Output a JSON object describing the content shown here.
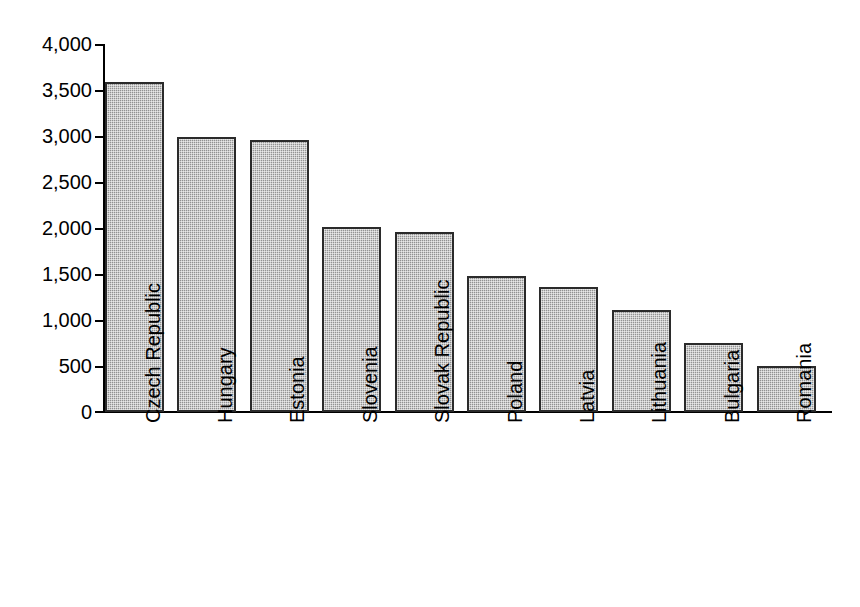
{
  "chart_data": {
    "type": "bar",
    "title": "",
    "subtitle": "",
    "xlabel": "",
    "ylabel": "",
    "ylim": [
      0,
      4000
    ],
    "ytick_step": 500,
    "grid": false,
    "legend": null,
    "bar_fill_color": "#a3a3a3",
    "bar_border_color": "#2b2b2b",
    "axis_color": "#000000",
    "background_color": "#ffffff",
    "ytick_labels": [
      "4,000",
      "3,500",
      "3,000",
      "2,500",
      "2,000",
      "1,500",
      "1,000",
      "500",
      "0"
    ],
    "ytick_values": [
      4000,
      3500,
      3000,
      2500,
      2000,
      1500,
      1000,
      500,
      0
    ],
    "categories": [
      "Czech Republic",
      "Hungary",
      "Estonia",
      "Slovenia",
      "Slovak Republic",
      "Poland",
      "Latvia",
      "Lithuania",
      "Bulgaria",
      "Romania"
    ],
    "values": [
      3590,
      2985,
      2955,
      2015,
      1960,
      1475,
      1355,
      1105,
      755,
      500
    ]
  }
}
